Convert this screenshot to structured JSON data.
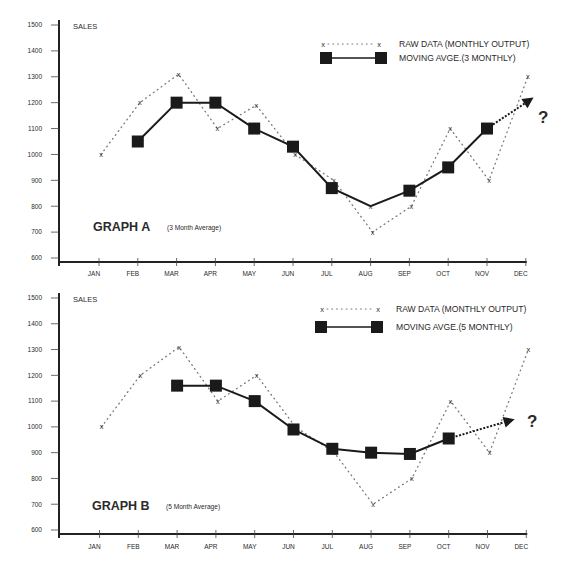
{
  "chart_data": [
    {
      "type": "line",
      "title": "GRAPH A",
      "subtitle": "(3 Month Average)",
      "ylabel": "SALES",
      "xlabel": "",
      "categories": [
        "JAN",
        "FEB",
        "MAR",
        "APR",
        "MAY",
        "JUN",
        "JUL",
        "AUG",
        "SEP",
        "OCT",
        "NOV",
        "DEC"
      ],
      "yticks": [
        600,
        700,
        800,
        900,
        1000,
        1100,
        1200,
        1300,
        1400,
        1500
      ],
      "ylim": [
        600,
        1500
      ],
      "grid": false,
      "legend_position": "top-right",
      "series": [
        {
          "name": "RAW DATA (MONTHLY OUTPUT)",
          "style": "dotted",
          "marker": "x",
          "color": "#777777",
          "values": [
            1000,
            1200,
            1310,
            1100,
            1190,
            1000,
            900,
            700,
            800,
            1100,
            900,
            1300
          ]
        },
        {
          "name": "MOVING AVGE.(3 MONTHLY)",
          "style": "solid",
          "marker": "square",
          "color": "#1a1a1a",
          "values": [
            null,
            1050,
            1200,
            1200,
            1100,
            1030,
            870,
            800,
            860,
            950,
            1100,
            null
          ],
          "unmarked_points": [
            "AUG"
          ]
        }
      ],
      "forecast": {
        "from_category": "NOV",
        "from_value": 1100,
        "to_month_index": 11.2,
        "to_value": 1220,
        "style": "dotted-arrow",
        "label": "?"
      }
    },
    {
      "type": "line",
      "title": "GRAPH B",
      "subtitle": "(5 Month Average)",
      "ylabel": "SALES",
      "xlabel": "",
      "categories": [
        "JAN",
        "FEB",
        "MAR",
        "APR",
        "MAY",
        "JUN",
        "JUL",
        "AUG",
        "SEP",
        "OCT",
        "NOV",
        "DEC"
      ],
      "yticks": [
        600,
        700,
        800,
        900,
        1000,
        1100,
        1200,
        1300,
        1400,
        1500
      ],
      "ylim": [
        600,
        1500
      ],
      "grid": false,
      "legend_position": "top-right",
      "series": [
        {
          "name": "RAW DATA (MONTHLY OUTPUT)",
          "style": "dotted",
          "marker": "x",
          "color": "#777777",
          "values": [
            1000,
            1200,
            1310,
            1100,
            1200,
            1000,
            900,
            700,
            800,
            1100,
            900,
            1300
          ]
        },
        {
          "name": "MOVING AVGE.(5 MONTHLY)",
          "style": "solid",
          "marker": "square",
          "color": "#1a1a1a",
          "values": [
            null,
            null,
            1160,
            1160,
            1100,
            990,
            915,
            900,
            895,
            955,
            null,
            null
          ],
          "unmarked_points": []
        }
      ],
      "forecast": {
        "from_category": "OCT",
        "from_value": 955,
        "to_month_index": 10.7,
        "to_value": 1030,
        "style": "dotted-arrow",
        "label": "?"
      }
    }
  ]
}
